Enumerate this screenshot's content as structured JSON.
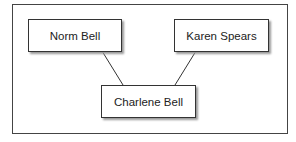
{
  "diagram": {
    "type": "family-tree",
    "nodes": [
      {
        "id": "norm",
        "label": "Norm Bell"
      },
      {
        "id": "karen",
        "label": "Karen Spears"
      },
      {
        "id": "charlene",
        "label": "Charlene Bell"
      }
    ],
    "edges": [
      {
        "from": "norm",
        "to": "charlene"
      },
      {
        "from": "karen",
        "to": "charlene"
      }
    ]
  }
}
